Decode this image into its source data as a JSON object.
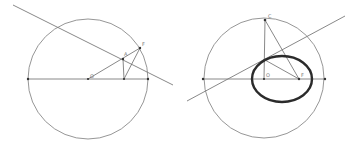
{
  "figure": {
    "colors": {
      "background": "#ffffff",
      "construction": "#8a8a8a",
      "ellipse": "#2b2b2b",
      "points": "#333333"
    },
    "left_panel": {
      "circle": {
        "cx": 88,
        "cy": 79,
        "r": 60
      },
      "diameter": {
        "x1": 28,
        "y1": 79,
        "x2": 148,
        "y2": 79
      },
      "secant_line": {
        "x1": 13,
        "y1": 5,
        "x2": 173,
        "y2": 85
      },
      "points": [
        {
          "id": "O",
          "label": "O",
          "x": 88,
          "y": 79
        },
        {
          "id": "A",
          "label": "A",
          "x": 123,
          "y": 59
        },
        {
          "id": "F",
          "label": "F",
          "x": 140,
          "y": 48
        },
        {
          "id": "H",
          "label": "",
          "x": 124,
          "y": 79
        },
        {
          "id": "L",
          "label": "",
          "x": 28,
          "y": 79
        },
        {
          "id": "R",
          "label": "",
          "x": 148,
          "y": 79
        }
      ],
      "labels": {
        "O": "O",
        "A": "A",
        "F": "F"
      }
    },
    "right_panel": {
      "circle": {
        "cx": 264,
        "cy": 78,
        "r": 60
      },
      "diameter": {
        "x1": 203,
        "y1": 79,
        "x2": 325,
        "y2": 79
      },
      "tangent_line": {
        "x1": 187,
        "y1": 101,
        "x2": 345,
        "y2": 16
      },
      "ellipse": {
        "cx": 282,
        "cy": 79,
        "rx": 30,
        "ry": 23
      },
      "points": [
        {
          "id": "C",
          "label": "C",
          "x": 265,
          "y": 20
        },
        {
          "id": "O2",
          "label": "O",
          "x": 264,
          "y": 79
        },
        {
          "id": "F2",
          "label": "F",
          "x": 299,
          "y": 79
        },
        {
          "id": "T",
          "label": "",
          "x": 265,
          "y": 60
        },
        {
          "id": "L2",
          "label": "",
          "x": 203,
          "y": 79
        },
        {
          "id": "R2",
          "label": "",
          "x": 325,
          "y": 79
        }
      ],
      "labels": {
        "C": "C",
        "O": "O",
        "F": "F"
      }
    }
  }
}
